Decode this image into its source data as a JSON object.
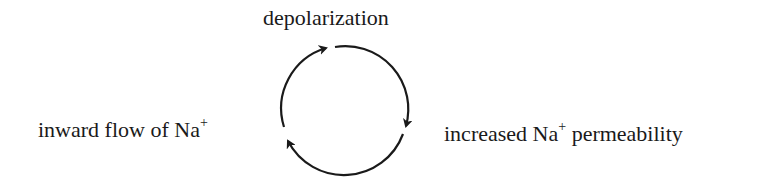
{
  "diagram": {
    "type": "cycle",
    "nodes": [
      {
        "id": "depolarization",
        "text": "depolarization",
        "superscript": ""
      },
      {
        "id": "permeability",
        "text_before": "increased Na",
        "superscript": "+",
        "text_after": " permeability"
      },
      {
        "id": "inward-flow",
        "text_before": "inward flow of Na",
        "superscript": "+",
        "text_after": ""
      }
    ],
    "edges": [
      {
        "from": "depolarization",
        "to": "permeability",
        "direction": "clockwise"
      },
      {
        "from": "permeability",
        "to": "inward-flow",
        "direction": "clockwise"
      },
      {
        "from": "inward-flow",
        "to": "depolarization",
        "direction": "clockwise"
      }
    ],
    "colors": {
      "stroke": "#1a1a1a",
      "background": "#ffffff"
    }
  }
}
